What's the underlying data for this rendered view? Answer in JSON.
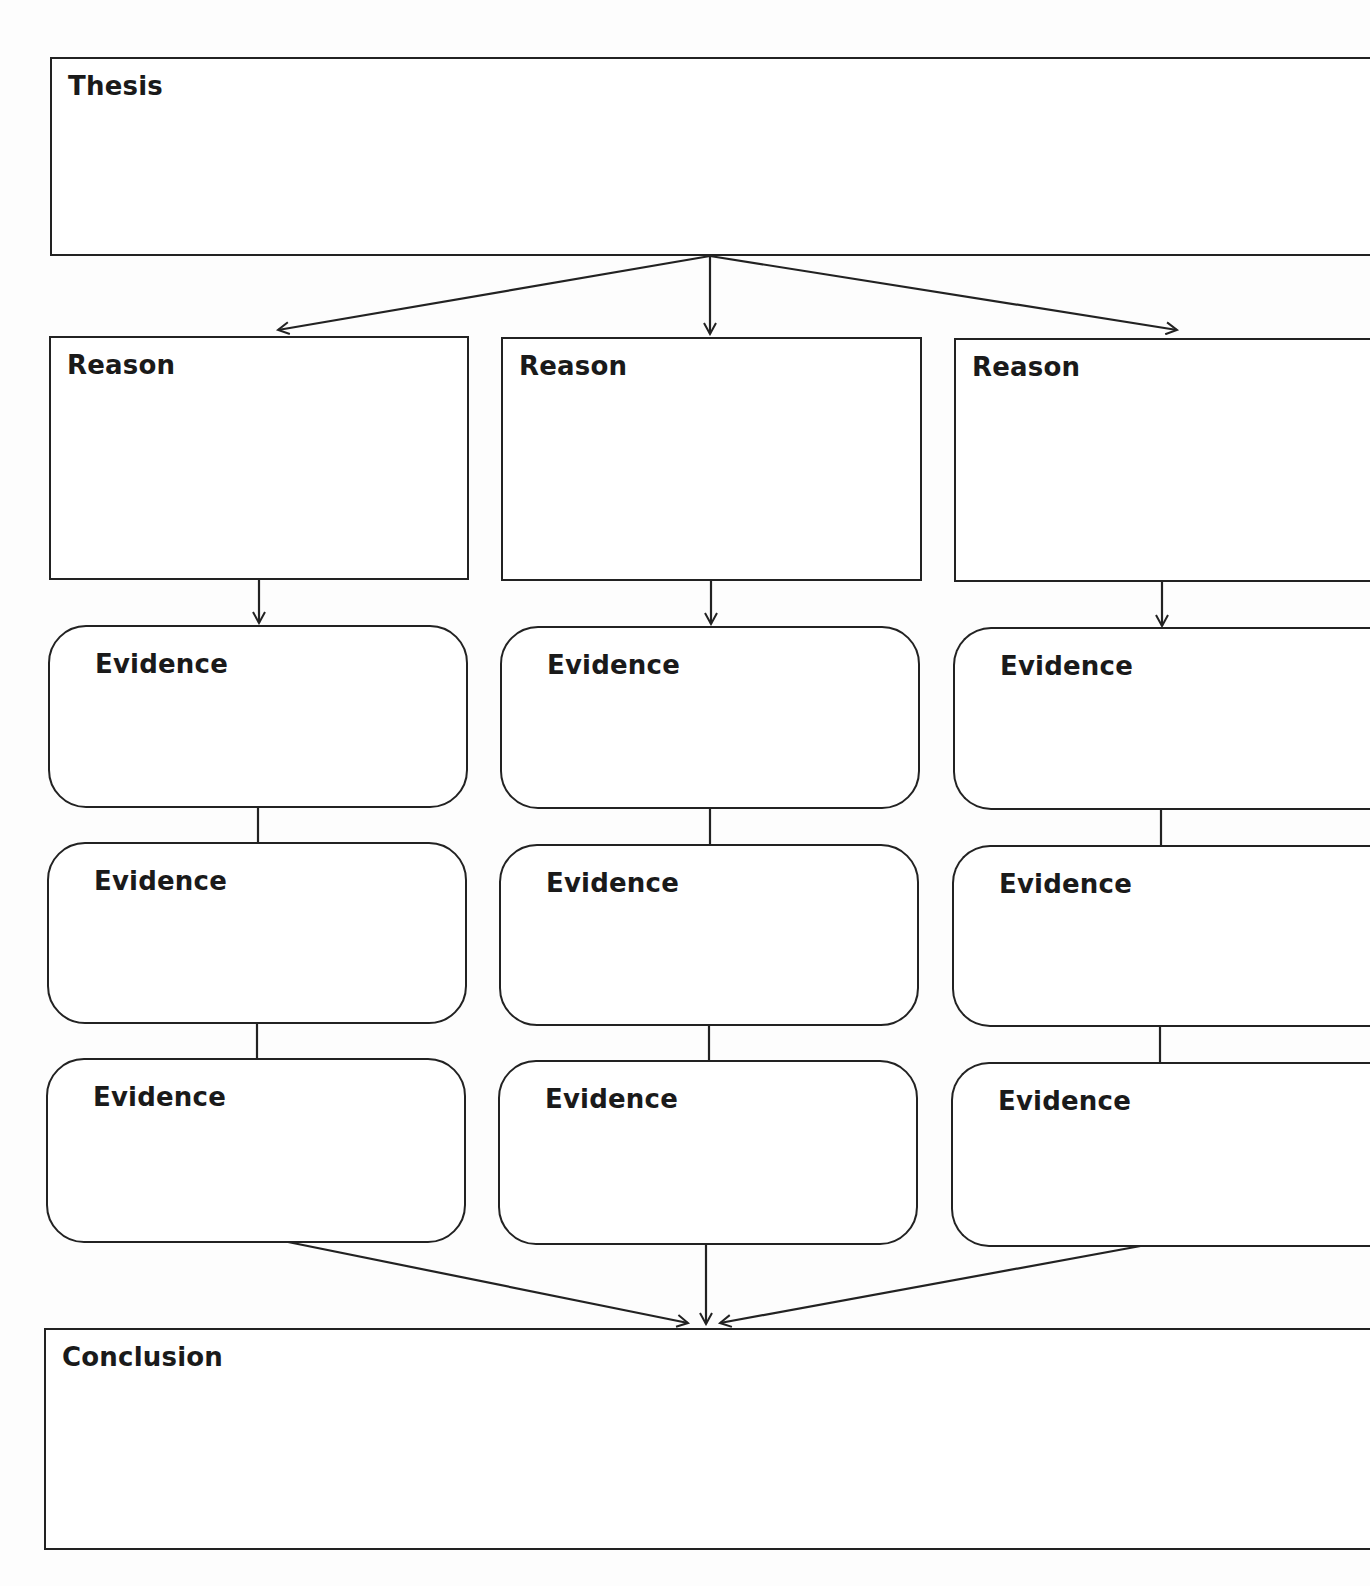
{
  "diagram": {
    "title_cropped": "",
    "thesis": {
      "label": "Thesis"
    },
    "reasons": [
      {
        "label": "Reason"
      },
      {
        "label": "Reason"
      },
      {
        "label": "Reason"
      }
    ],
    "evidence_columns": [
      {
        "items": [
          {
            "label": "Evidence"
          },
          {
            "label": "Evidence"
          },
          {
            "label": "Evidence"
          }
        ]
      },
      {
        "items": [
          {
            "label": "Evidence"
          },
          {
            "label": "Evidence"
          },
          {
            "label": "Evidence"
          }
        ]
      },
      {
        "items": [
          {
            "label": "Evidence"
          },
          {
            "label": "Evidence"
          },
          {
            "label": "Evidence"
          }
        ]
      }
    ],
    "conclusion": {
      "label": "Conclusion"
    },
    "colors": {
      "stroke": "#222222",
      "background": "#fdfdfd",
      "text": "#1a1a1a"
    }
  }
}
